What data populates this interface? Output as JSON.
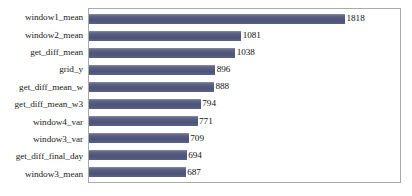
{
  "chart_data": {
    "type": "bar",
    "orientation": "horizontal",
    "title": "",
    "subtitle": "",
    "xlabel": "",
    "ylabel": "",
    "grid": false,
    "legend": null,
    "xlim": [
      0,
      1818
    ],
    "axis_ticks": [],
    "categories": [
      "window1_mean",
      "window2_mean",
      "get_diff_mean",
      "grid_y",
      "get_diff_mean_w",
      "get_diff_mean_w3",
      "window4_var",
      "window3_var",
      "get_diff_final_day",
      "window3_mean"
    ],
    "values": [
      1818,
      1081,
      1038,
      896,
      888,
      794,
      771,
      709,
      694,
      687
    ],
    "value_labels": [
      "1818",
      "1081",
      "1038",
      "896",
      "888",
      "794",
      "771",
      "709",
      "694",
      "687"
    ],
    "colors": {
      "bar": "#545a7d",
      "bar_highlight": "#6d7193",
      "plot_border": "#a9a9a9",
      "background": "#ffffff",
      "text": "#1b1b1b"
    }
  }
}
